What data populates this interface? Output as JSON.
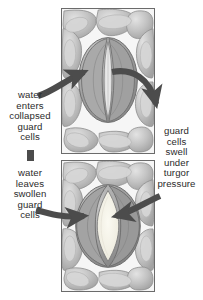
{
  "figure": {
    "colors": {
      "ink": "#2b2b2b",
      "arrow": "#4c4c4c",
      "panel_border": "#6b6b6b",
      "epidermis_fill": "#b8b8b8",
      "epidermis_light": "#d9d9d9",
      "guard_cell_fill": "#9a9a9a",
      "guard_cell_light": "#c4c4c4",
      "pore_closed": "#e8e8e8",
      "pore_open": "#f4f2ea",
      "background": "#ffffff"
    }
  },
  "panels": [
    {
      "id": "panel-closed",
      "name": "closed-stoma-panel",
      "state": "closed",
      "description": "Leaf epidermis with collapsed guard cells and a closed stomatal pore"
    },
    {
      "id": "panel-open",
      "name": "open-stoma-panel",
      "state": "open",
      "description": "Leaf epidermis with swollen guard cells and an open stomatal pore"
    }
  ],
  "captions": {
    "water_enters": "water\nenters\ncollapsed\nguard\ncells",
    "water_leaves": "water\nleaves\nswollen\nguard\ncells",
    "turgor": "guard\ncells\nswell\nunder\nturgor\npressure"
  },
  "arrows": [
    {
      "name": "arrow-water-in-left",
      "direction": "right",
      "from": "water enters caption",
      "to": "closed stoma"
    },
    {
      "name": "arrow-turgor-right",
      "direction": "down-right",
      "from": "closed stoma",
      "to": "turgor pressure caption"
    },
    {
      "name": "arrow-water-out-left",
      "direction": "right",
      "from": "water leaves caption",
      "to": "open stoma"
    },
    {
      "name": "arrow-turgor-in-right",
      "direction": "left",
      "from": "turgor pressure caption",
      "to": "open stoma"
    },
    {
      "name": "arrow-cycle-stub",
      "direction": "down",
      "from": "water enters caption",
      "to": "water leaves caption"
    }
  ]
}
